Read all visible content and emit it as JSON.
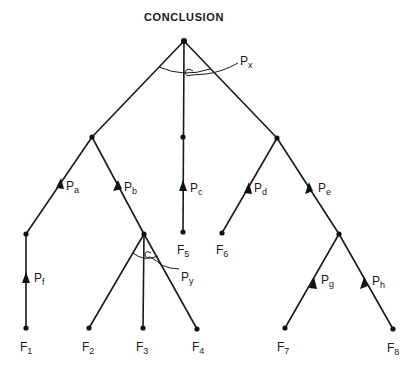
{
  "diagram": {
    "title": "CONCLUSION",
    "colors": {
      "ink": "#1a1a1a",
      "background": "#ffffff"
    },
    "nodes": [
      {
        "id": "root",
        "x": 184,
        "y": 41
      },
      {
        "id": "left",
        "x": 92,
        "y": 137
      },
      {
        "id": "mid",
        "x": 183,
        "y": 137
      },
      {
        "id": "right",
        "x": 277,
        "y": 138
      },
      {
        "id": "lf",
        "x": 26,
        "y": 234
      },
      {
        "id": "lb",
        "x": 144,
        "y": 234
      },
      {
        "id": "rd",
        "x": 222,
        "y": 233
      },
      {
        "id": "re",
        "x": 339,
        "y": 234
      },
      {
        "id": "F5node",
        "x": 183,
        "y": 232
      }
    ],
    "facts": [
      {
        "label": "F",
        "sub": "1",
        "x": 26,
        "y": 328
      },
      {
        "label": "F",
        "sub": "2",
        "x": 89,
        "y": 328
      },
      {
        "label": "F",
        "sub": "3",
        "x": 143,
        "y": 328
      },
      {
        "label": "F",
        "sub": "4",
        "x": 197,
        "y": 329
      },
      {
        "label": "F",
        "sub": "5",
        "x": 183,
        "y": 232
      },
      {
        "label": "F",
        "sub": "6",
        "x": 222,
        "y": 233
      },
      {
        "label": "F",
        "sub": "7",
        "x": 285,
        "y": 328
      },
      {
        "label": "F",
        "sub": "8",
        "x": 393,
        "y": 329
      }
    ],
    "edge_labels": [
      {
        "label": "P",
        "sub": "a"
      },
      {
        "label": "P",
        "sub": "b"
      },
      {
        "label": "P",
        "sub": "c"
      },
      {
        "label": "P",
        "sub": "d"
      },
      {
        "label": "P",
        "sub": "e"
      },
      {
        "label": "P",
        "sub": "f"
      },
      {
        "label": "P",
        "sub": "g"
      },
      {
        "label": "P",
        "sub": "h"
      }
    ],
    "conjunction_labels": [
      {
        "label": "P",
        "sub": "x"
      },
      {
        "label": "P",
        "sub": "y"
      }
    ]
  }
}
